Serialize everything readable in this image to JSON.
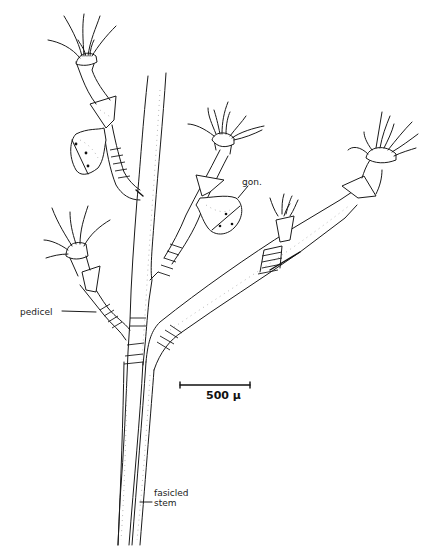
{
  "figure": {
    "type": "scientific-illustration",
    "line_color": "#1a1a1a",
    "background_color": "#ffffff"
  },
  "labels": {
    "gonophore": "gon.",
    "pedicel": "pedicel",
    "stem_line1": "fasicled",
    "stem_line2": "stem"
  },
  "scale_bar": {
    "value": "500",
    "unit": "µ",
    "label": "500 µ"
  }
}
